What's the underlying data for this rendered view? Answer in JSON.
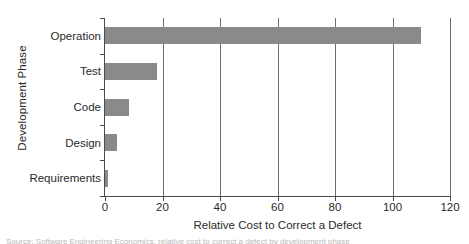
{
  "chart_data": {
    "type": "bar",
    "orientation": "horizontal",
    "title": "",
    "xlabel": "Relative Cost to Correct a Defect",
    "ylabel": "Development Phase",
    "categories": [
      "Operation",
      "Test",
      "Code",
      "Design",
      "Requirements"
    ],
    "values": [
      110,
      18,
      8.5,
      4,
      1
    ],
    "xlim": [
      0,
      120
    ],
    "xticks": [
      0,
      20,
      40,
      60,
      80,
      100,
      120
    ],
    "xtick_labels": [
      "0",
      "20",
      "40",
      "60",
      "80",
      "100",
      "120"
    ],
    "grid": "vertical gridlines at each x tick",
    "legend": "none",
    "bar_color": "#8a8a8a",
    "axis_color": "#4a4a4a",
    "gridline_color": "#6f6f6f",
    "series": [
      {
        "name": "Relative Cost to Correct a Defect",
        "values": [
          110,
          18,
          8.5,
          4,
          1
        ]
      }
    ]
  },
  "caption": {
    "sliver_text": "Source: Software Engineering Economics, relative cost to correct a defect by development phase"
  }
}
